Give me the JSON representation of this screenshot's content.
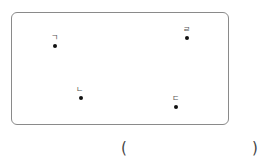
{
  "diagram": {
    "points": [
      {
        "label": "ㄱ",
        "x": 55,
        "y": 46,
        "label_dx": -4,
        "label_dy": -12
      },
      {
        "label": "ㄴ",
        "x": 81,
        "y": 98,
        "label_dx": -5,
        "label_dy": -12
      },
      {
        "label": "ㄷ",
        "x": 176,
        "y": 107,
        "label_dx": -4,
        "label_dy": -12
      },
      {
        "label": "ㄹ",
        "x": 187,
        "y": 38,
        "label_dx": -4,
        "label_dy": -12
      }
    ]
  },
  "answer": {
    "open_paren": "(",
    "close_paren": ")",
    "value": ""
  }
}
